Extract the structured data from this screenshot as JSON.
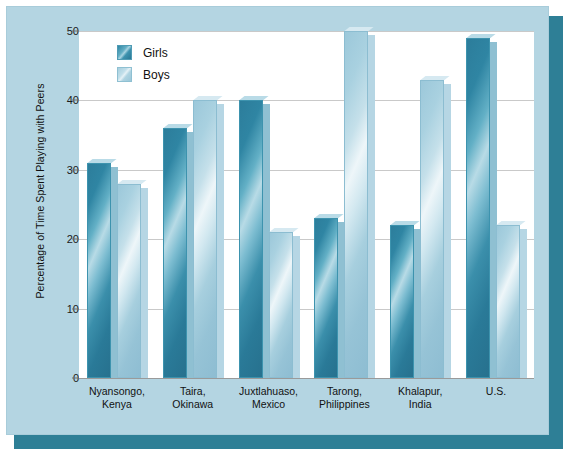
{
  "chart_data": {
    "type": "bar",
    "title": "",
    "subtitle": "",
    "xlabel": "",
    "ylabel": "Percentage of Time Spent Playing with Peers",
    "ylim": [
      0,
      50
    ],
    "yticks": [
      0,
      10,
      20,
      30,
      40,
      50
    ],
    "grid": true,
    "legend_position": "top-left",
    "categories": [
      "Nyansongo,\nKenya",
      "Taira,\nOkinawa",
      "Juxtlahuaso,\nMexico",
      "Tarong,\nPhilippines",
      "Khalapur,\nIndia",
      "U.S."
    ],
    "category_lines": [
      [
        "Nyansongo,",
        "Kenya"
      ],
      [
        "Taira,",
        "Okinawa"
      ],
      [
        "Juxtlahuaso,",
        "Mexico"
      ],
      [
        "Tarong,",
        "Philippines"
      ],
      [
        "Khalapur,",
        "India"
      ],
      [
        "U.S.",
        ""
      ]
    ],
    "series": [
      {
        "name": "Girls",
        "color": "#2f86a4",
        "values": [
          31,
          36,
          40,
          23,
          22,
          49
        ]
      },
      {
        "name": "Boys",
        "color": "#a7cfde",
        "values": [
          28,
          40,
          21,
          50,
          43,
          22
        ]
      }
    ]
  },
  "legend": {
    "items": [
      {
        "label": "Girls",
        "key": "girls"
      },
      {
        "label": "Boys",
        "key": "boys"
      }
    ]
  },
  "axis": {
    "y_title": "Percentage of Time Spent Playing with Peers",
    "y_tick_labels": [
      "50",
      "40",
      "30",
      "20",
      "10",
      "0"
    ]
  },
  "colors": {
    "panel_background": "#b4d5e2",
    "plot_background": "#ffffff",
    "shadow": "#2e7f96",
    "gridline": "#c9c9c9",
    "girls_bar": "#2f86a4",
    "boys_bar": "#a7cfde",
    "text": "#111111"
  }
}
